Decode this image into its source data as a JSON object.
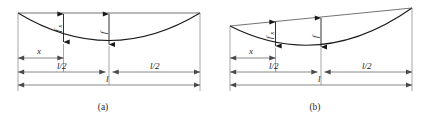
{
  "figure": {
    "background_color": "#ffffff",
    "line_color": "#1a1a1a",
    "dim_color": "#6a6a6a",
    "panels": [
      {
        "id": "a",
        "caption": "(a)",
        "description": "Symmetric parabola with horizontal chord; equal supports",
        "labels": {
          "sag_at_x": "f",
          "sag_at_x_sub": "x",
          "sag_mid": "f",
          "distance_x": "x",
          "half_span_left": "l/2",
          "half_span_right": "l/2",
          "span": "l"
        }
      },
      {
        "id": "b",
        "caption": "(b)",
        "description": "Parabola with inclined chord; right support higher than left",
        "labels": {
          "sag_at_x": "f",
          "sag_at_x_sub": "x",
          "sag_mid": "f",
          "distance_x": "x",
          "half_span_left": "l/2",
          "half_span_right": "l/2",
          "span": "l"
        }
      }
    ]
  }
}
